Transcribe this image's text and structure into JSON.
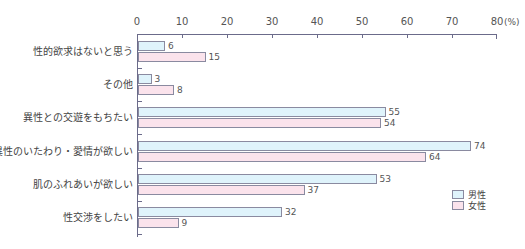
{
  "chart_data": {
    "type": "bar",
    "orientation": "horizontal",
    "title": "",
    "xlabel": "(%)",
    "ylabel": "",
    "xlim": [
      0,
      80
    ],
    "xticks": [
      0,
      10,
      20,
      30,
      40,
      50,
      60,
      70,
      80
    ],
    "x_unit": "(%)",
    "grid": false,
    "legend_position": "lower right",
    "categories": [
      "性的欲求はないと思う",
      "その他",
      "異性との交遊をもちたい",
      "異性のいたわり・愛情が欲しい",
      "肌のふれあいが欲しい",
      "性交渉をしたい"
    ],
    "series": [
      {
        "name": "男性",
        "color": "#dff3fb",
        "values": [
          6,
          3,
          55,
          74,
          53,
          32
        ]
      },
      {
        "name": "女性",
        "color": "#fbe3ec",
        "values": [
          15,
          8,
          54,
          64,
          37,
          9
        ]
      }
    ]
  },
  "axis": {
    "ticks": [
      "0",
      "10",
      "20",
      "30",
      "40",
      "50",
      "60",
      "70",
      "80"
    ],
    "unit": "(%)"
  },
  "legend": {
    "male": "男性",
    "female": "女性"
  },
  "colors": {
    "male": "#dff3fb",
    "female": "#fbe3ec",
    "border": "#8a8aa0",
    "axis": "#6b6b8a"
  }
}
